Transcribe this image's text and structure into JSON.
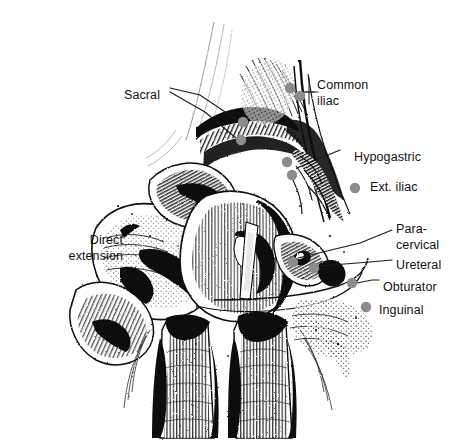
{
  "figure": {
    "background_color": "#ffffff",
    "ink_color": "#000000",
    "node_color": "#8c8c8c",
    "leader_color": "#1a1a1a",
    "cropped_header_text": "· ··  ·"
  },
  "labels": [
    {
      "id": "sacral",
      "text": "Sacral",
      "lines": [
        "Sacral"
      ],
      "x": 124,
      "y": 88,
      "align": "left"
    },
    {
      "id": "common-iliac",
      "text": "Common iliac",
      "lines": [
        "Common",
        "iliac"
      ],
      "x": 317,
      "y": 78,
      "align": "left"
    },
    {
      "id": "hypogastric",
      "text": "Hypogastric",
      "lines": [
        "Hypogastric"
      ],
      "x": 354,
      "y": 150,
      "align": "left"
    },
    {
      "id": "ext-iliac",
      "text": "Ext. iliac",
      "lines": [
        "Ext. iliac"
      ],
      "x": 370,
      "y": 180,
      "align": "left"
    },
    {
      "id": "para-cervical",
      "text": "Para-cervical",
      "lines": [
        "Para-",
        "cervical"
      ],
      "x": 396,
      "y": 222,
      "align": "left"
    },
    {
      "id": "ureteral",
      "text": "Ureteral",
      "lines": [
        "Ureteral"
      ],
      "x": 396,
      "y": 258,
      "align": "left"
    },
    {
      "id": "obturator",
      "text": "Obturator",
      "lines": [
        "Obturator"
      ],
      "x": 383,
      "y": 280,
      "align": "left"
    },
    {
      "id": "inguinal",
      "text": "Inguinal",
      "lines": [
        "Inguinal"
      ],
      "x": 379,
      "y": 303,
      "align": "left"
    },
    {
      "id": "direct-extension",
      "text": "Direct extension",
      "lines": [
        "Direct",
        "extension"
      ],
      "x": 17,
      "y": 233,
      "align": "right"
    }
  ],
  "nodes": [
    {
      "id": "node-sacral-upper",
      "label": "sacral",
      "cx": 243,
      "cy": 122,
      "r": 5.2
    },
    {
      "id": "node-sacral-lower",
      "label": "sacral",
      "cx": 241,
      "cy": 140,
      "r": 5.2
    },
    {
      "id": "node-common-iliac-1",
      "label": "common-iliac",
      "cx": 290,
      "cy": 88,
      "r": 5.2
    },
    {
      "id": "node-common-iliac-2",
      "label": "common-iliac",
      "cx": 300,
      "cy": 96,
      "r": 5.2
    },
    {
      "id": "node-hypogastric-1",
      "label": "hypogastric",
      "cx": 287,
      "cy": 162,
      "r": 5.2
    },
    {
      "id": "node-hypogastric-2",
      "label": "hypogastric",
      "cx": 292,
      "cy": 175,
      "r": 5.2
    },
    {
      "id": "node-ext-iliac",
      "label": "ext-iliac",
      "cx": 355,
      "cy": 188,
      "r": 5.2
    },
    {
      "id": "node-paracervical",
      "label": "para-cervical",
      "cx": 293,
      "cy": 262,
      "r": 5.2
    },
    {
      "id": "node-ureteral",
      "label": "ureteral",
      "cx": 314,
      "cy": 268,
      "r": 5.2
    },
    {
      "id": "node-obturator",
      "label": "obturator",
      "cx": 352,
      "cy": 283,
      "r": 5.2
    },
    {
      "id": "node-inguinal",
      "label": "inguinal",
      "cx": 366,
      "cy": 307,
      "r": 5.2
    }
  ],
  "leaders": [
    {
      "id": "leader-sacral-a",
      "from": "sacral",
      "points": "170,88 200,95 237,120"
    },
    {
      "id": "leader-sacral-b",
      "from": "sacral",
      "points": "170,92 205,112 236,138"
    },
    {
      "id": "leader-common-iliac",
      "from": "common-iliac",
      "points": "305,92 314,92"
    },
    {
      "id": "leader-hypogastric",
      "from": "hypogastric",
      "points": "297,168 340,150"
    },
    {
      "id": "leader-paracervical",
      "from": "para-cervical",
      "points": "298,258 360,243 392,230"
    },
    {
      "id": "leader-ureteral",
      "from": "ureteral",
      "points": "319,266 370,262 392,260"
    },
    {
      "id": "leader-obturator",
      "from": "obturator",
      "points": "357,283 372,280 379,280"
    }
  ],
  "tick_marks": [
    {
      "id": "tick-common-iliac-v",
      "points": "309,78 309,104"
    },
    {
      "id": "tick-common-iliac-h",
      "points": "300,92 318,92"
    }
  ]
}
